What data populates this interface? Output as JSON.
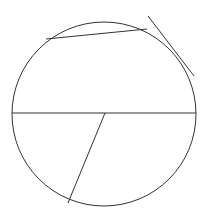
{
  "diagram": {
    "width": 206,
    "height": 219,
    "background": "#ffffff",
    "stroke_color": "#333333",
    "circle": {
      "cx": 104,
      "cy": 114,
      "r": 92
    },
    "diameter": {
      "x1": 12,
      "y1": 113,
      "x2": 196,
      "y2": 113
    },
    "upper_chord": {
      "x1": 46,
      "y1": 39,
      "x2": 147,
      "y2": 29
    },
    "tangent_line": {
      "x1": 148,
      "y1": 16,
      "x2": 194,
      "y2": 76
    },
    "radial_segment": {
      "x1": 105,
      "y1": 113,
      "x2": 68,
      "y2": 203
    }
  }
}
